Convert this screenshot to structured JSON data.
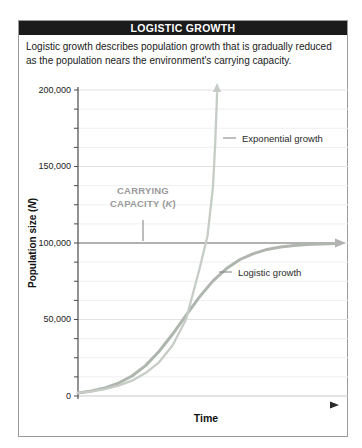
{
  "card": {
    "title": "LOGISTIC GROWTH",
    "description_line1": "Logistic growth describes population growth that is gradually reduced",
    "description_line2": "as the population nears the environment's carrying capacity."
  },
  "chart_data": {
    "type": "line",
    "title": "LOGISTIC GROWTH",
    "xlabel": "Time",
    "ylabel": "Population size (N)",
    "ylabel_parts": [
      "Population size (",
      "N",
      ")"
    ],
    "ylim": [
      0,
      200000
    ],
    "xlim_time_units": [
      0,
      10
    ],
    "yticks": [
      0,
      50000,
      100000,
      150000,
      200000
    ],
    "ytick_labels": [
      "0",
      "50,000",
      "100,000",
      "150,000",
      "200,000"
    ],
    "minor_tick_step": 12500,
    "grid": "horizontal",
    "legend_position": "inline-annotations",
    "annotations": {
      "carrying_capacity": {
        "label_line1": "CARRYING",
        "label_line2": "CAPACITY (K)",
        "label_line2_parts": [
          "CAPACITY (",
          "K",
          ")"
        ],
        "value": 100000,
        "style": "horizontal gray arrow at N=100,000"
      }
    },
    "series": [
      {
        "name": "Exponential growth",
        "style": "light gray-green curve, arrow pointing up, leaves chart near t=5.2",
        "points": [
          [
            0,
            2000
          ],
          [
            0.5,
            3000
          ],
          [
            1,
            4500
          ],
          [
            1.5,
            6800
          ],
          [
            2,
            10000
          ],
          [
            2.5,
            15000
          ],
          [
            3,
            22000
          ],
          [
            3.5,
            33000
          ],
          [
            4,
            50000
          ],
          [
            4.5,
            83000
          ],
          [
            4.8,
            105000
          ],
          [
            5,
            137000
          ],
          [
            5.08,
            165000
          ],
          [
            5.15,
            198000
          ]
        ]
      },
      {
        "name": "Logistic growth",
        "style": "gray-green S-curve leveling at carrying capacity 100,000",
        "points": [
          [
            0,
            2000
          ],
          [
            0.5,
            3300
          ],
          [
            1,
            5300
          ],
          [
            1.5,
            8400
          ],
          [
            2,
            13100
          ],
          [
            2.5,
            19900
          ],
          [
            3,
            29100
          ],
          [
            3.5,
            40300
          ],
          [
            4,
            52700
          ],
          [
            4.5,
            64800
          ],
          [
            5,
            75200
          ],
          [
            5.5,
            83300
          ],
          [
            6,
            89200
          ],
          [
            6.5,
            93100
          ],
          [
            7,
            95800
          ],
          [
            7.5,
            97400
          ],
          [
            8,
            98400
          ],
          [
            8.5,
            99000
          ],
          [
            9,
            99400
          ],
          [
            9.6,
            99700
          ]
        ]
      }
    ]
  },
  "colors": {
    "title_bar_bg": "#1b1b1b",
    "title_text": "#ffffff",
    "card_border": "#9b9b9b",
    "axis": "#4a4a4a",
    "grid_major": "#e2e2e2",
    "grid_minor": "#efefef",
    "zero_line": "#c9c9c9",
    "capacity_line": "#b1b1b1",
    "capacity_label": "#9a9a9a",
    "exponential_curve": "#c6ccc6",
    "logistic_curve": "#aeb6ae",
    "time_arrow_dark": "#2a2a2a",
    "time_arrow_light": "#cccccc",
    "text": "#1a1a1a"
  }
}
